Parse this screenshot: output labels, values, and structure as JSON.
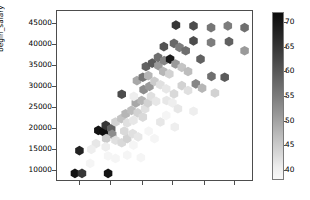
{
  "figure": {
    "background_color": "#ffffff",
    "axes_edge_color": "#4d4d4d"
  },
  "chart_data": {
    "type": "heatmap",
    "subtype": "hexbin",
    "title": "",
    "xlabel": "",
    "ylabel": "begin_salary",
    "colormap": "Greys",
    "grid": false,
    "legend_position": "right-colorbar",
    "xlim": [
      0,
      1
    ],
    "ylim": [
      7400,
      48200
    ],
    "yticks": [
      10000,
      15000,
      20000,
      25000,
      30000,
      35000,
      40000,
      45000
    ],
    "ytick_labels": [
      "10000",
      "15000",
      "20000",
      "25000",
      "30000",
      "35000",
      "40000",
      "45000"
    ],
    "xticks": [
      0.115,
      0.275,
      0.435,
      0.59,
      0.75,
      0.905
    ],
    "xtick_labels": [
      "",
      "",
      "",
      "",
      "",
      ""
    ],
    "colorbar": {
      "label": "",
      "vmin": 38,
      "vmax": 72,
      "ticks": [
        40,
        45,
        50,
        55,
        60,
        65,
        70
      ],
      "tick_labels": [
        "40",
        "45",
        "50",
        "55",
        "60",
        "65",
        "70"
      ],
      "orientation": "vertical"
    },
    "hexagons": [
      {
        "x": 0.092,
        "y": 9000,
        "v": 71
      },
      {
        "x": 0.128,
        "y": 9000,
        "v": 66
      },
      {
        "x": 0.262,
        "y": 9000,
        "v": 71
      },
      {
        "x": 0.115,
        "y": 14500,
        "v": 69
      },
      {
        "x": 0.212,
        "y": 19400,
        "v": 71
      },
      {
        "x": 0.24,
        "y": 19000,
        "v": 72
      },
      {
        "x": 0.25,
        "y": 20600,
        "v": 66
      },
      {
        "x": 0.278,
        "y": 19800,
        "v": 60
      },
      {
        "x": 0.283,
        "y": 18400,
        "v": 54
      },
      {
        "x": 0.252,
        "y": 17400,
        "v": 45
      },
      {
        "x": 0.3,
        "y": 17000,
        "v": 42
      },
      {
        "x": 0.332,
        "y": 16400,
        "v": 43
      },
      {
        "x": 0.36,
        "y": 17400,
        "v": 44
      },
      {
        "x": 0.345,
        "y": 19200,
        "v": 43
      },
      {
        "x": 0.388,
        "y": 18600,
        "v": 42
      },
      {
        "x": 0.416,
        "y": 17800,
        "v": 41
      },
      {
        "x": 0.3,
        "y": 21400,
        "v": 44
      },
      {
        "x": 0.33,
        "y": 22200,
        "v": 46
      },
      {
        "x": 0.36,
        "y": 21200,
        "v": 42
      },
      {
        "x": 0.392,
        "y": 21800,
        "v": 41
      },
      {
        "x": 0.352,
        "y": 23400,
        "v": 48
      },
      {
        "x": 0.382,
        "y": 24200,
        "v": 47
      },
      {
        "x": 0.414,
        "y": 23600,
        "v": 44
      },
      {
        "x": 0.44,
        "y": 22600,
        "v": 43
      },
      {
        "x": 0.452,
        "y": 24600,
        "v": 42
      },
      {
        "x": 0.404,
        "y": 26000,
        "v": 50
      },
      {
        "x": 0.434,
        "y": 26600,
        "v": 48
      },
      {
        "x": 0.466,
        "y": 26000,
        "v": 44
      },
      {
        "x": 0.332,
        "y": 28100,
        "v": 63
      },
      {
        "x": 0.394,
        "y": 27600,
        "v": 40
      },
      {
        "x": 0.482,
        "y": 27600,
        "v": 42
      },
      {
        "x": 0.508,
        "y": 26400,
        "v": 41
      },
      {
        "x": 0.444,
        "y": 29200,
        "v": 54
      },
      {
        "x": 0.474,
        "y": 30000,
        "v": 52
      },
      {
        "x": 0.41,
        "y": 31400,
        "v": 50
      },
      {
        "x": 0.44,
        "y": 32200,
        "v": 57
      },
      {
        "x": 0.468,
        "y": 32600,
        "v": 48
      },
      {
        "x": 0.5,
        "y": 31200,
        "v": 45
      },
      {
        "x": 0.53,
        "y": 30400,
        "v": 42
      },
      {
        "x": 0.56,
        "y": 29400,
        "v": 41
      },
      {
        "x": 0.562,
        "y": 26600,
        "v": 41
      },
      {
        "x": 0.592,
        "y": 26000,
        "v": 40
      },
      {
        "x": 0.456,
        "y": 34800,
        "v": 60
      },
      {
        "x": 0.488,
        "y": 35600,
        "v": 61
      },
      {
        "x": 0.52,
        "y": 35000,
        "v": 52
      },
      {
        "x": 0.545,
        "y": 33600,
        "v": 48
      },
      {
        "x": 0.576,
        "y": 33000,
        "v": 44
      },
      {
        "x": 0.518,
        "y": 37000,
        "v": 58
      },
      {
        "x": 0.55,
        "y": 36200,
        "v": 55
      },
      {
        "x": 0.58,
        "y": 36600,
        "v": 70
      },
      {
        "x": 0.608,
        "y": 35400,
        "v": 52
      },
      {
        "x": 0.64,
        "y": 34600,
        "v": 46
      },
      {
        "x": 0.672,
        "y": 33600,
        "v": 47
      },
      {
        "x": 0.548,
        "y": 39600,
        "v": 62
      },
      {
        "x": 0.6,
        "y": 40400,
        "v": 59
      },
      {
        "x": 0.628,
        "y": 39400,
        "v": 56
      },
      {
        "x": 0.66,
        "y": 38600,
        "v": 58
      },
      {
        "x": 0.61,
        "y": 44800,
        "v": 66
      },
      {
        "x": 0.7,
        "y": 44600,
        "v": 63
      },
      {
        "x": 0.79,
        "y": 44200,
        "v": 57
      },
      {
        "x": 0.876,
        "y": 44600,
        "v": 56
      },
      {
        "x": 0.962,
        "y": 44200,
        "v": 58
      },
      {
        "x": 0.7,
        "y": 41000,
        "v": 63
      },
      {
        "x": 0.79,
        "y": 40600,
        "v": 56
      },
      {
        "x": 0.882,
        "y": 40800,
        "v": 60
      },
      {
        "x": 0.962,
        "y": 38600,
        "v": 52
      },
      {
        "x": 0.736,
        "y": 36600,
        "v": 60
      },
      {
        "x": 0.792,
        "y": 32400,
        "v": 58
      },
      {
        "x": 0.86,
        "y": 32200,
        "v": 61
      },
      {
        "x": 0.712,
        "y": 30600,
        "v": 55
      },
      {
        "x": 0.744,
        "y": 29600,
        "v": 48
      },
      {
        "x": 0.81,
        "y": 28400,
        "v": 44
      },
      {
        "x": 0.64,
        "y": 30200,
        "v": 44
      },
      {
        "x": 0.672,
        "y": 29000,
        "v": 42
      },
      {
        "x": 0.6,
        "y": 28200,
        "v": 43
      },
      {
        "x": 0.62,
        "y": 24600,
        "v": 41
      },
      {
        "x": 0.7,
        "y": 24000,
        "v": 40
      },
      {
        "x": 0.53,
        "y": 21400,
        "v": 41
      },
      {
        "x": 0.604,
        "y": 20200,
        "v": 40
      },
      {
        "x": 0.2,
        "y": 16200,
        "v": 41
      },
      {
        "x": 0.176,
        "y": 14800,
        "v": 40
      },
      {
        "x": 0.25,
        "y": 15400,
        "v": 40
      },
      {
        "x": 0.262,
        "y": 13200,
        "v": 39
      },
      {
        "x": 0.3,
        "y": 12600,
        "v": 39
      },
      {
        "x": 0.36,
        "y": 13400,
        "v": 39
      },
      {
        "x": 0.43,
        "y": 12800,
        "v": 39
      },
      {
        "x": 0.392,
        "y": 15800,
        "v": 39
      },
      {
        "x": 0.47,
        "y": 19200,
        "v": 39
      },
      {
        "x": 0.5,
        "y": 17400,
        "v": 39
      },
      {
        "x": 0.56,
        "y": 23000,
        "v": 39
      },
      {
        "x": 0.17,
        "y": 11400,
        "v": 39
      }
    ]
  }
}
